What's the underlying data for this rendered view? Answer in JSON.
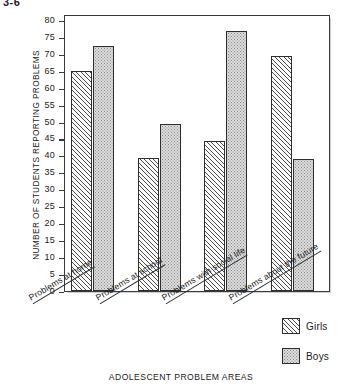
{
  "page": {
    "header_fragment": "3-6"
  },
  "chart_data": {
    "type": "bar",
    "title": "",
    "xlabel": "ADOLESCENT PROBLEM AREAS",
    "ylabel": "NUMBER OF STUDENTS REPORTING PROBLEMS",
    "categories": [
      "Problems at home",
      "Problems at school",
      "Problems with social life",
      "Problems about the future"
    ],
    "series": [
      {
        "name": "Girls",
        "values": [
          65,
          39.5,
          44.5,
          69.5
        ],
        "fill": "diagonal-hatch"
      },
      {
        "name": "Boys",
        "values": [
          72.5,
          49.5,
          77,
          39
        ],
        "fill": "stipple-dots"
      }
    ],
    "ylim": [
      0,
      82
    ],
    "ytick_values": [
      0,
      5,
      10,
      15,
      20,
      25,
      30,
      35,
      40,
      45,
      50,
      55,
      60,
      65,
      70,
      75,
      80
    ],
    "ytick_labels": [
      "0",
      "5",
      "10",
      "15",
      "20",
      "25",
      "30",
      "35",
      "40",
      "45",
      "50",
      "55",
      "60",
      "65",
      "70",
      "75",
      "80"
    ],
    "grid": false,
    "legend_position": "bottom-right",
    "legend_entries": [
      "Girls",
      "Boys"
    ]
  },
  "colors": {
    "axis": "#3a3a3a",
    "bar_outline": "#2e2e2e",
    "girls_fill": "#fdfdfd",
    "boys_fill": "#dcdcdc",
    "background": "#ffffff"
  }
}
